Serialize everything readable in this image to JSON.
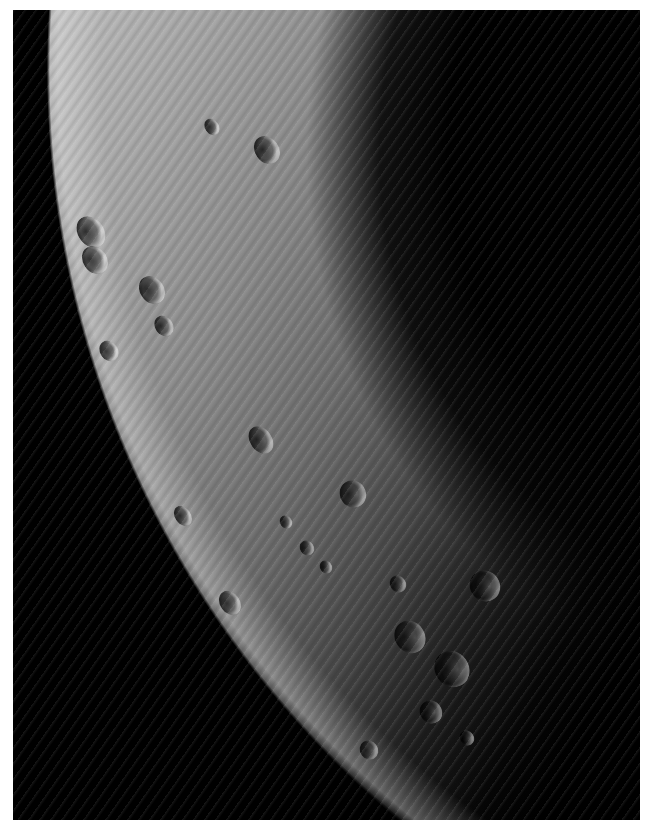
{
  "image": {
    "subject": "Cratered planetary surface near terminator and limb",
    "border_color": "#ffffff",
    "space_color": "#000000",
    "surface_light": "#b8b8b8",
    "surface_mid": "#7a7a7a",
    "surface_dark": "#2a2a2a"
  },
  "craters": [
    {
      "x": 78,
      "y": 215,
      "w": 26,
      "h": 34
    },
    {
      "x": 83,
      "y": 245,
      "w": 24,
      "h": 30
    },
    {
      "x": 140,
      "y": 275,
      "w": 24,
      "h": 30
    },
    {
      "x": 155,
      "y": 315,
      "w": 18,
      "h": 22
    },
    {
      "x": 255,
      "y": 135,
      "w": 24,
      "h": 30
    },
    {
      "x": 205,
      "y": 118,
      "w": 14,
      "h": 18
    },
    {
      "x": 250,
      "y": 425,
      "w": 22,
      "h": 30
    },
    {
      "x": 340,
      "y": 480,
      "w": 26,
      "h": 28
    },
    {
      "x": 280,
      "y": 515,
      "w": 12,
      "h": 14
    },
    {
      "x": 300,
      "y": 540,
      "w": 14,
      "h": 16
    },
    {
      "x": 320,
      "y": 560,
      "w": 12,
      "h": 14
    },
    {
      "x": 390,
      "y": 575,
      "w": 16,
      "h": 18
    },
    {
      "x": 395,
      "y": 620,
      "w": 30,
      "h": 34
    },
    {
      "x": 435,
      "y": 650,
      "w": 34,
      "h": 38
    },
    {
      "x": 470,
      "y": 570,
      "w": 30,
      "h": 32
    },
    {
      "x": 420,
      "y": 700,
      "w": 22,
      "h": 24
    },
    {
      "x": 220,
      "y": 590,
      "w": 20,
      "h": 26
    },
    {
      "x": 175,
      "y": 505,
      "w": 16,
      "h": 22
    },
    {
      "x": 100,
      "y": 340,
      "w": 18,
      "h": 22
    },
    {
      "x": 360,
      "y": 740,
      "w": 18,
      "h": 20
    },
    {
      "x": 460,
      "y": 730,
      "w": 14,
      "h": 16
    }
  ]
}
